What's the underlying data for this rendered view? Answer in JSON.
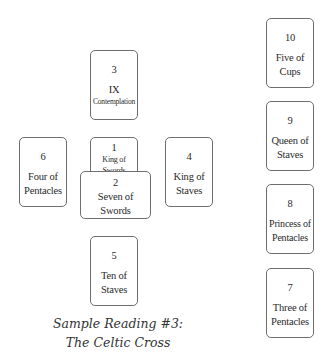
{
  "cards": [
    {
      "number": "1",
      "name": "King of\nSwords"
    },
    {
      "number": "2",
      "name": "Seven of\nSwords"
    },
    {
      "number": "3",
      "name": "IX",
      "subtitle": "Contemplation"
    },
    {
      "number": "4",
      "name": "King of\nStaves"
    },
    {
      "number": "5",
      "name": "Ten of\nStaves"
    },
    {
      "number": "6",
      "name": "Four of\nPentacles"
    },
    {
      "number": "7",
      "name": "Three of\nPentacles"
    },
    {
      "number": "8",
      "name": "Princess of\nPentacles"
    },
    {
      "number": "9",
      "name": "Queen of\nStaves"
    },
    {
      "number": "10",
      "name": "Five of\nCups"
    }
  ],
  "caption": {
    "line1": "Sample Reading #3:",
    "line2": "The Celtic Cross"
  },
  "colors": {
    "card_border": "#6e6e6e",
    "text": "#2a2a2a",
    "background": "#ffffff"
  }
}
